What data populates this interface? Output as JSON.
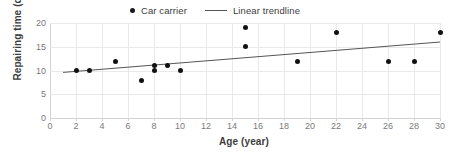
{
  "chart_data": {
    "type": "scatter",
    "title": "",
    "xlabel": "Age (year)",
    "ylabel": "Repairing time (day)",
    "xlim": [
      0,
      30
    ],
    "ylim": [
      0,
      20
    ],
    "xticks": [
      0,
      2,
      4,
      6,
      8,
      10,
      12,
      14,
      16,
      18,
      20,
      22,
      24,
      26,
      28,
      30
    ],
    "yticks": [
      0,
      5,
      10,
      15,
      20
    ],
    "grid": true,
    "legend_position": "top-center",
    "series": [
      {
        "name": "Car carrier",
        "type": "scatter",
        "marker": "circle",
        "color": "#111111",
        "points": [
          {
            "x": 2,
            "y": 10
          },
          {
            "x": 3,
            "y": 10
          },
          {
            "x": 5,
            "y": 12
          },
          {
            "x": 7,
            "y": 8
          },
          {
            "x": 8,
            "y": 11
          },
          {
            "x": 8,
            "y": 10
          },
          {
            "x": 9,
            "y": 11
          },
          {
            "x": 10,
            "y": 10
          },
          {
            "x": 15,
            "y": 19
          },
          {
            "x": 15,
            "y": 15
          },
          {
            "x": 19,
            "y": 12
          },
          {
            "x": 22,
            "y": 18
          },
          {
            "x": 26,
            "y": 12
          },
          {
            "x": 28,
            "y": 12
          },
          {
            "x": 30,
            "y": 18
          }
        ]
      },
      {
        "name": "Linear trendline",
        "type": "line",
        "color": "#555555",
        "endpoints": [
          {
            "x": 1,
            "y": 9.6
          },
          {
            "x": 30,
            "y": 16.0
          }
        ]
      }
    ]
  },
  "legend": {
    "entries": [
      {
        "label": "Car carrier",
        "marker": "dot"
      },
      {
        "label": "Linear trendline",
        "marker": "line"
      }
    ]
  },
  "axes": {
    "x_title": "Age (year)",
    "y_title": "Repairing time (day)"
  },
  "colors": {
    "marker": "#111111",
    "trendline": "#555555",
    "gridline": "#e9e9e9",
    "axis": "#d4d4d4",
    "tick_text": "#7a7a7a",
    "axis_title": "#3d3d3d",
    "background": "#ffffff"
  }
}
